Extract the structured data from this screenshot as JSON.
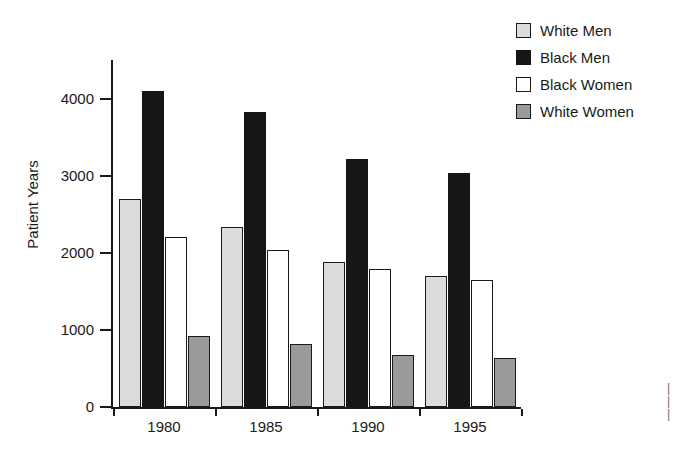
{
  "chart_data": {
    "type": "bar",
    "title": "",
    "xlabel": "",
    "ylabel": "Patient Years",
    "categories": [
      "1980",
      "1985",
      "1990",
      "1995"
    ],
    "ylim": [
      0,
      4500
    ],
    "yticks": [
      0,
      1000,
      2000,
      3000,
      4000
    ],
    "ytick_labels": [
      "0",
      "1000",
      "2000",
      "3000",
      "4000"
    ],
    "grid": false,
    "legend_position": "top-right",
    "series": [
      {
        "name": "White Men",
        "color": "#dcdcdc",
        "values": [
          2700,
          2340,
          1880,
          1700
        ]
      },
      {
        "name": "Black Men",
        "color": "#161616",
        "values": [
          4100,
          3820,
          3220,
          3030
        ]
      },
      {
        "name": "Black Women",
        "color": "#ffffff",
        "values": [
          2200,
          2030,
          1790,
          1650
        ]
      },
      {
        "name": "White Women",
        "color": "#9a9a9a",
        "values": [
          920,
          820,
          680,
          640
        ]
      }
    ]
  },
  "axis": {
    "y_title": "Patient Years"
  },
  "edge_marks": "|\n|\n|"
}
